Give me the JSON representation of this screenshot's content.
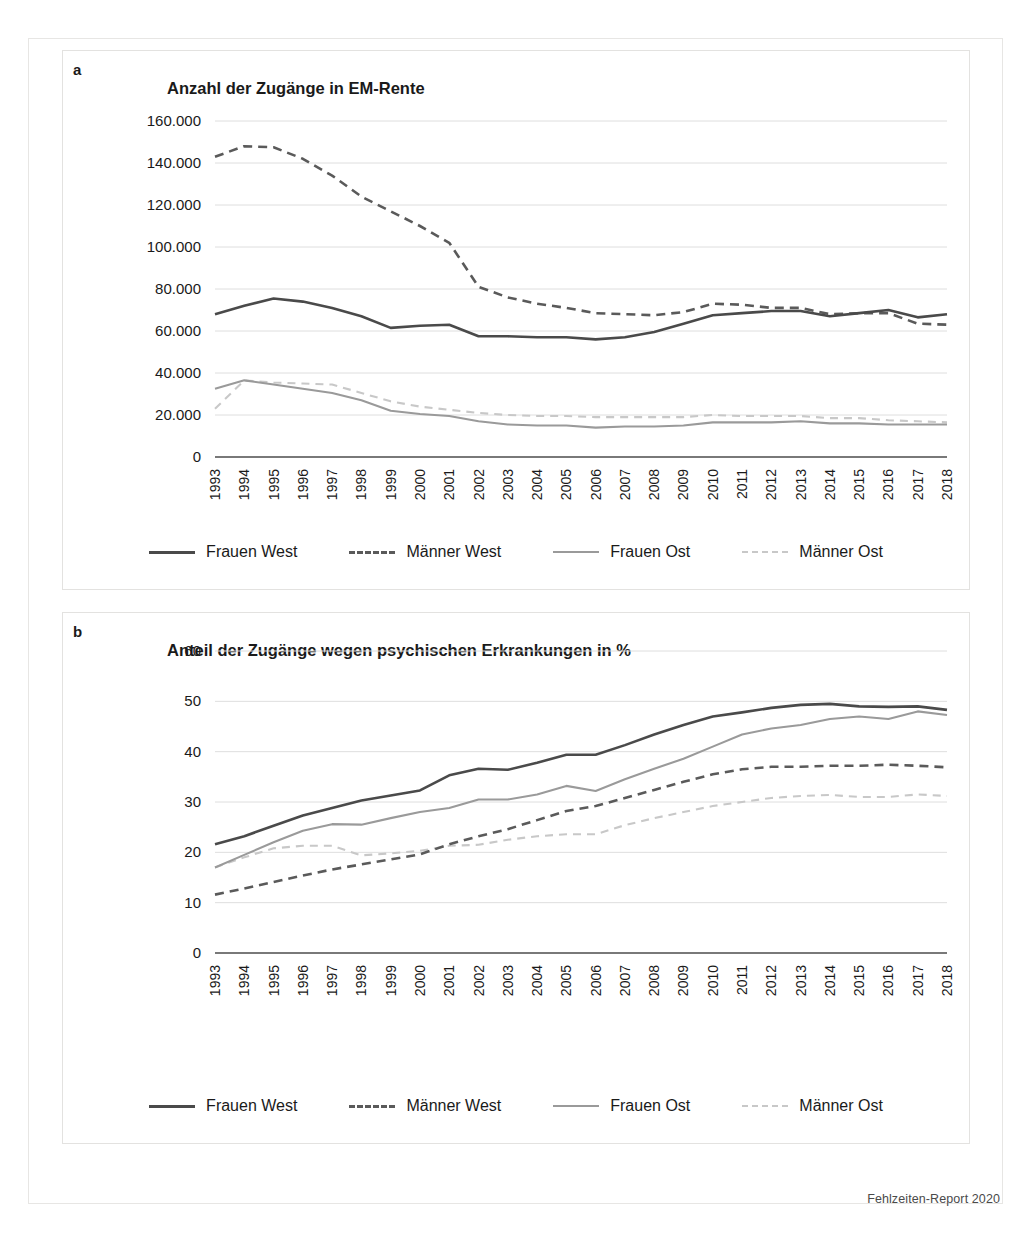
{
  "source_note": "Fehlzeiten-Report 2020",
  "panel_a": {
    "letter": "a",
    "legend": [
      {
        "label": "Frauen West",
        "color": "#4a4a4a",
        "dash": "solid",
        "width": 2.6
      },
      {
        "label": "Männer West",
        "color": "#5a5a5a",
        "dash": "dashed",
        "width": 2.6
      },
      {
        "label": "Frauen Ost",
        "color": "#9a9a9a",
        "dash": "solid",
        "width": 2.2
      },
      {
        "label": "Männer Ost",
        "color": "#c8c8c8",
        "dash": "dashed",
        "width": 2.2
      }
    ]
  },
  "panel_b": {
    "letter": "b",
    "legend": [
      {
        "label": "Frauen West",
        "color": "#4a4a4a",
        "dash": "solid",
        "width": 2.6
      },
      {
        "label": "Männer West",
        "color": "#5a5a5a",
        "dash": "dashed",
        "width": 2.6
      },
      {
        "label": "Frauen Ost",
        "color": "#9a9a9a",
        "dash": "solid",
        "width": 2.2
      },
      {
        "label": "Männer Ost",
        "color": "#c8c8c8",
        "dash": "dashed",
        "width": 2.2
      }
    ]
  },
  "chart_data": [
    {
      "id": "a",
      "type": "line",
      "title": "Anzahl der Zugänge in EM-Rente",
      "xlabel": "",
      "ylabel": "",
      "ylim": [
        0,
        160000
      ],
      "yticks": [
        0,
        20000,
        40000,
        60000,
        80000,
        100000,
        120000,
        140000,
        160000
      ],
      "ytick_labels": [
        "0",
        "20.000",
        "40.000",
        "60.000",
        "80.000",
        "100.000",
        "120.000",
        "140.000",
        "160.000"
      ],
      "grid": true,
      "legend_position": "bottom",
      "categories": [
        "1993",
        "1994",
        "1995",
        "1996",
        "1997",
        "1998",
        "1999",
        "2000",
        "2001",
        "2002",
        "2003",
        "2004",
        "2005",
        "2006",
        "2007",
        "2008",
        "2009",
        "2010",
        "2011",
        "2012",
        "2013",
        "2014",
        "2015",
        "2016",
        "2017",
        "2018"
      ],
      "series": [
        {
          "name": "Frauen West",
          "color": "#4a4a4a",
          "dash": "solid",
          "values": [
            68000,
            72000,
            75500,
            74000,
            71000,
            67000,
            61500,
            62500,
            63000,
            57500,
            57500,
            57000,
            57000,
            56000,
            57000,
            59500,
            63500,
            67500,
            68500,
            69500,
            69500,
            67000,
            68500,
            70000,
            66500,
            68000
          ]
        },
        {
          "name": "Männer West",
          "color": "#5a5a5a",
          "dash": "dashed",
          "values": [
            143000,
            148000,
            147500,
            142000,
            134000,
            124000,
            117000,
            110000,
            102000,
            81000,
            76000,
            73000,
            71000,
            68500,
            68000,
            67500,
            69000,
            73000,
            72500,
            71000,
            71000,
            68000,
            68500,
            68500,
            63500,
            63000
          ]
        },
        {
          "name": "Frauen Ost",
          "color": "#9a9a9a",
          "dash": "solid",
          "values": [
            32500,
            36500,
            34500,
            32500,
            30500,
            27000,
            22000,
            20500,
            19500,
            17000,
            15500,
            15000,
            15000,
            14000,
            14500,
            14500,
            15000,
            16500,
            16500,
            16500,
            17000,
            16000,
            16000,
            15500,
            15500,
            15500
          ]
        },
        {
          "name": "Männer Ost",
          "color": "#c8c8c8",
          "dash": "dashed",
          "values": [
            23000,
            36500,
            35500,
            35000,
            34500,
            30500,
            26500,
            24000,
            22500,
            21000,
            20000,
            19500,
            19500,
            19000,
            19000,
            19000,
            19000,
            20000,
            19500,
            19500,
            19500,
            18500,
            18500,
            17500,
            17000,
            16500
          ]
        }
      ]
    },
    {
      "id": "b",
      "type": "line",
      "title": "Anteil der Zugänge wegen psychischen Erkrankungen in %",
      "xlabel": "",
      "ylabel": "%",
      "ylim": [
        0,
        60
      ],
      "yticks": [
        0,
        10,
        20,
        30,
        40,
        50,
        60
      ],
      "ytick_labels": [
        "0",
        "10",
        "20",
        "30",
        "40",
        "50",
        "60"
      ],
      "grid": true,
      "legend_position": "bottom",
      "categories": [
        "1993",
        "1994",
        "1995",
        "1996",
        "1997",
        "1998",
        "1999",
        "2000",
        "2001",
        "2002",
        "2003",
        "2004",
        "2005",
        "2006",
        "2007",
        "2008",
        "2009",
        "2010",
        "2011",
        "2012",
        "2013",
        "2014",
        "2015",
        "2016",
        "2017",
        "2018"
      ],
      "series": [
        {
          "name": "Frauen West",
          "color": "#4a4a4a",
          "dash": "solid",
          "values": [
            21.6,
            23.2,
            25.3,
            27.3,
            28.8,
            30.3,
            31.3,
            32.3,
            35.3,
            36.6,
            36.4,
            37.8,
            39.4,
            39.4,
            41.3,
            43.4,
            45.3,
            47.0,
            47.8,
            48.7,
            49.3,
            49.5,
            49.0,
            48.9,
            49.0,
            48.3
          ]
        },
        {
          "name": "Männer West",
          "color": "#5a5a5a",
          "dash": "dashed",
          "values": [
            11.6,
            12.8,
            14.1,
            15.4,
            16.6,
            17.6,
            18.6,
            19.6,
            21.6,
            23.2,
            24.6,
            26.4,
            28.2,
            29.2,
            30.8,
            32.4,
            34.0,
            35.5,
            36.5,
            37.0,
            37.0,
            37.2,
            37.2,
            37.4,
            37.2,
            36.9
          ]
        },
        {
          "name": "Frauen Ost",
          "color": "#9a9a9a",
          "dash": "solid",
          "values": [
            17.0,
            19.5,
            22.0,
            24.3,
            25.6,
            25.5,
            26.8,
            28.0,
            28.8,
            30.5,
            30.5,
            31.5,
            33.2,
            32.2,
            34.5,
            36.6,
            38.6,
            41.0,
            43.4,
            44.6,
            45.3,
            46.5,
            47.0,
            46.5,
            48.0,
            47.3
          ]
        },
        {
          "name": "Männer Ost",
          "color": "#c8c8c8",
          "dash": "dashed",
          "values": [
            17.0,
            19.0,
            20.8,
            21.3,
            21.3,
            19.4,
            19.8,
            20.3,
            21.3,
            21.5,
            22.5,
            23.2,
            23.6,
            23.6,
            25.4,
            26.8,
            28.0,
            29.2,
            30.0,
            30.8,
            31.2,
            31.4,
            31.0,
            31.0,
            31.5,
            31.2
          ]
        }
      ]
    }
  ]
}
